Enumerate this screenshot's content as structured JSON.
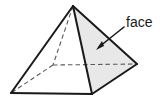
{
  "figure": {
    "name": "square-pyramid-face-diagram",
    "canvas": {
      "width": 163,
      "height": 102
    },
    "background_color": "#ffffff",
    "solid_edge_color": "#1a1a1a",
    "hidden_edge_color": "#5a5a5a",
    "shade_color": "#e8e8e8",
    "shade_border_color": "#1a1a1a",
    "vertices": {
      "apex": [
        73,
        6
      ],
      "base_left": [
        11,
        93
      ],
      "base_front": [
        92,
        94
      ],
      "base_right": [
        137,
        64
      ],
      "base_back_hidden": [
        53,
        65
      ]
    },
    "solid_edges": [
      {
        "name": "apex-to-base-left",
        "points": "73,6 11,93"
      },
      {
        "name": "apex-to-base-front",
        "points": "73,6 92,94"
      },
      {
        "name": "apex-to-base-right",
        "points": "73,6 137,64"
      },
      {
        "name": "base-left-to-base-front",
        "points": "11,93 92,94"
      },
      {
        "name": "base-front-to-base-right",
        "points": "92,94 137,64"
      }
    ],
    "hidden_edges": [
      {
        "name": "apex-to-base-back",
        "points": "73,6 53,65"
      },
      {
        "name": "base-back-to-base-right",
        "points": "53,65 137,64"
      },
      {
        "name": "base-back-to-base-left",
        "points": "53,65 11,93"
      }
    ],
    "shaded_faces": [
      {
        "name": "right-front-lateral-face",
        "points": "73,6 92,94 137,64",
        "fill": "#e8e8e8"
      }
    ]
  },
  "annotation": {
    "label": "face",
    "label_position": {
      "x": 126,
      "y": 27
    },
    "leader_line": {
      "points": "124,27 99,47"
    },
    "arrow_head": {
      "points": "96,50 104,46 102,41"
    },
    "arrow_color": "#1a1a1a",
    "points_to": "right-front-lateral-face"
  }
}
